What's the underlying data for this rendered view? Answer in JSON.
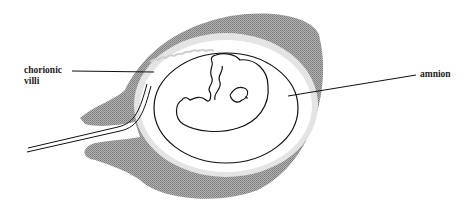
{
  "diagram": {
    "title": "",
    "labels": {
      "chorionic_villi_line1": "chorionic",
      "chorionic_villi_line2": "villi",
      "amnion": "amnion"
    },
    "structures": [
      {
        "name": "chorion (decidua/villi layer)",
        "style": "gray stippled band"
      },
      {
        "name": "chorionic cavity",
        "style": "light gray ring"
      },
      {
        "name": "amnion",
        "style": "black outline"
      },
      {
        "name": "embryo",
        "style": "black outline"
      },
      {
        "name": "umbilical/connecting stalk",
        "style": "double line"
      }
    ],
    "colors": {
      "chorion_gray": "#9a9a9a",
      "cavity_light": "#e4e4e4",
      "outline": "#111111",
      "label_text": "#222222"
    }
  }
}
